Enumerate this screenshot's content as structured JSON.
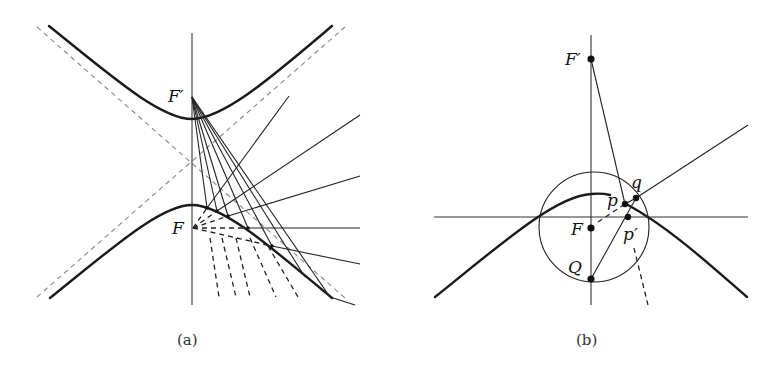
{
  "figure": {
    "panels": [
      {
        "id": "a",
        "caption": "(a)",
        "labels": {
          "focus_upper": "F′",
          "focus_lower": "F"
        }
      },
      {
        "id": "b",
        "caption": "(b)",
        "labels": {
          "focus_upper": "F′",
          "focus_lower": "F",
          "point_Q": "Q",
          "point_p": "p",
          "point_p_prime": "p′",
          "point_q": "q"
        }
      }
    ]
  }
}
